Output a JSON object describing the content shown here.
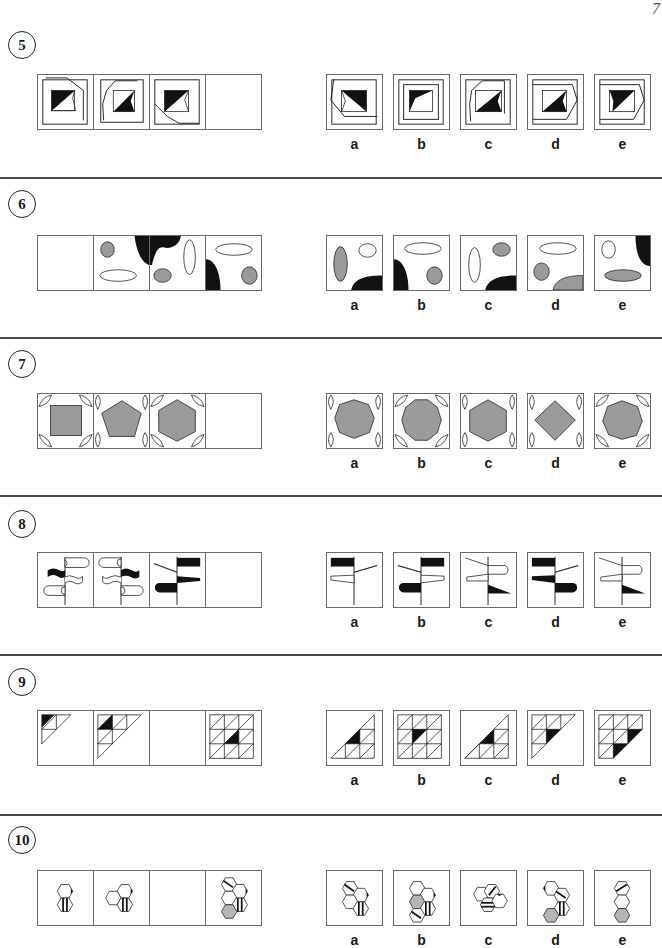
{
  "page": {
    "number": "7"
  },
  "colors": {
    "black": "#111111",
    "gray_fill": "#9a9a9a",
    "hex_gray": "#b5b5b5",
    "border": "#6a6a6a",
    "separator": "#4a4a4a"
  },
  "questions": [
    {
      "number": "5",
      "description": "Rotating polygon outline around a square with black/white diagonal split",
      "question_cells": [
        "polygon-square-1",
        "polygon-square-2",
        "polygon-square-3",
        "blank"
      ],
      "answer_labels": [
        "a",
        "b",
        "c",
        "d",
        "e"
      ]
    },
    {
      "number": "6",
      "description": "Ellipses and black quarter-blobs shifting positions",
      "question_cells": [
        "blank",
        "ellipses-1",
        "ellipses-2",
        "ellipses-3"
      ],
      "answer_labels": [
        "a",
        "b",
        "c",
        "d",
        "e"
      ]
    },
    {
      "number": "7",
      "description": "Gray polygon with increasing sides and corner leaf shapes",
      "question_cells": [
        "square",
        "pentagon",
        "hexagon",
        "blank"
      ],
      "answer_labels": [
        "a",
        "b",
        "c",
        "d",
        "e"
      ]
    },
    {
      "number": "8",
      "description": "Signpost with flags of different shapes",
      "question_cells": [
        "signpost-1",
        "signpost-2",
        "signpost-3",
        "blank"
      ],
      "answer_labels": [
        "a",
        "b",
        "c",
        "d",
        "e"
      ]
    },
    {
      "number": "9",
      "description": "Growing triangular grid with shaded triangle",
      "question_cells": [
        "triangle-grid-1",
        "triangle-grid-2",
        "blank",
        "triangle-grid-4"
      ],
      "answer_labels": [
        "a",
        "b",
        "c",
        "d",
        "e"
      ]
    },
    {
      "number": "10",
      "description": "Growing cluster of hexagons",
      "question_cells": [
        "hex-cluster-1",
        "hex-cluster-2",
        "blank",
        "hex-cluster-4"
      ],
      "answer_labels": [
        "a",
        "b",
        "c",
        "d",
        "e"
      ]
    }
  ]
}
